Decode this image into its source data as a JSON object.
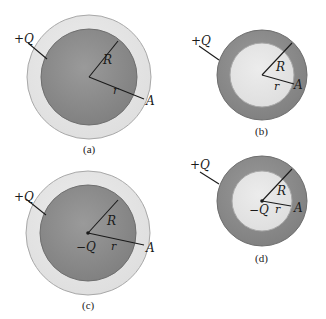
{
  "colors": {
    "background": "#ffffff",
    "dark_fill": "#8f8f8f",
    "dark_fill_edge": "#6e6e6e",
    "light_fill": "#e4e4e4",
    "light_fill_edge": "#a8a8a8",
    "ink": "#1a1a1a"
  },
  "panels": [
    {
      "id": "a",
      "caption": "(a)",
      "description": "Solid conducting sphere radius R inside concentric shell region; charge +Q on sphere",
      "outer_label": "+Q",
      "radius_label": "R",
      "distance_label": "r",
      "point_label": "A",
      "center_label": ""
    },
    {
      "id": "b",
      "caption": "(b)",
      "description": "Thick shell with inner cavity radius R; charge +Q",
      "outer_label": "+Q",
      "radius_label": "R",
      "distance_label": "r",
      "point_label": "A",
      "center_label": ""
    },
    {
      "id": "c",
      "caption": "(c)",
      "description": "Solid sphere with point charge -Q at center; charge +Q",
      "outer_label": "+Q",
      "radius_label": "R",
      "distance_label": "r",
      "point_label": "A",
      "center_label": "−Q"
    },
    {
      "id": "d",
      "caption": "(d)",
      "description": "Thick shell with cavity and point charge -Q at center; charge +Q",
      "outer_label": "+Q",
      "radius_label": "R",
      "distance_label": "r",
      "point_label": "A",
      "center_label": "−Q"
    }
  ]
}
